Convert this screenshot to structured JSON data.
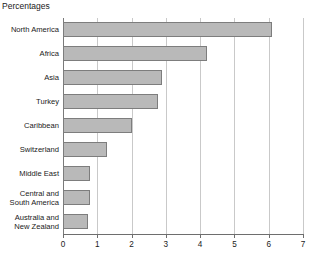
{
  "chart_data": {
    "type": "bar",
    "orientation": "horizontal",
    "title": "Percentages",
    "xlabel": "",
    "ylabel": "",
    "xlim": [
      0,
      7
    ],
    "xticks": [
      "0",
      "1",
      "2",
      "3",
      "4",
      "5",
      "6",
      "7"
    ],
    "grid": true,
    "legend": false,
    "bar_color": "#b9b9b9",
    "bar_border_color": "#7d7d7d",
    "gridline_color": "#c9c9c9",
    "axis_color": "#6e6e6e",
    "categories": [
      "North America",
      "Africa",
      "Asia",
      "Turkey",
      "Caribbean",
      "Switzerland",
      "Middle East",
      "Central and South America",
      "Australia and New Zealand"
    ],
    "values": [
      6.1,
      4.2,
      2.9,
      2.77,
      2.0,
      1.28,
      0.8,
      0.8,
      0.72
    ]
  }
}
